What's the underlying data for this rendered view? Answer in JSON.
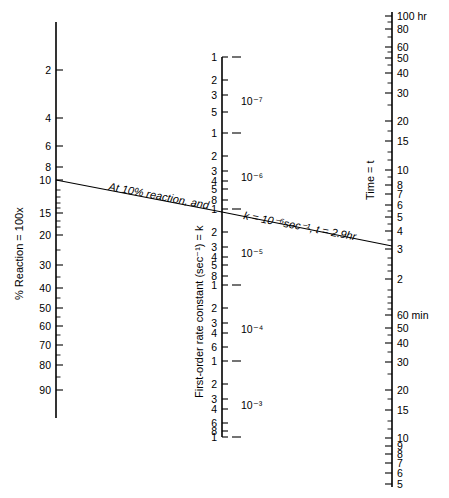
{
  "figure": {
    "type": "nomogram",
    "background_color": "#ffffff",
    "line_color": "#000000",
    "width": 449,
    "height": 498
  },
  "chart_data": {
    "type": "line",
    "title": "",
    "subtitle": "",
    "xlabel": "",
    "ylabel": "",
    "grid": false,
    "legend": "none",
    "axes": [
      {
        "id": "percent-reaction",
        "position": "left",
        "title": "% Reaction = 100x",
        "scale": "logarithmic-probability",
        "x_px": 56,
        "y_top_px": 22,
        "y_bottom_px": 418,
        "labeled_ticks": [
          {
            "label": "2",
            "y": 70
          },
          {
            "label": "4",
            "y": 118
          },
          {
            "label": "6",
            "y": 146
          },
          {
            "label": "8",
            "y": 167
          },
          {
            "label": "10",
            "y": 180
          },
          {
            "label": "15",
            "y": 213
          },
          {
            "label": "20",
            "y": 235
          },
          {
            "label": "30",
            "y": 265
          },
          {
            "label": "40",
            "y": 288
          },
          {
            "label": "50",
            "y": 308
          },
          {
            "label": "60",
            "y": 326
          },
          {
            "label": "70",
            "y": 345
          },
          {
            "label": "80",
            "y": 365
          },
          {
            "label": "90",
            "y": 390
          }
        ],
        "minor_ticks_y": [
          190,
          197,
          203,
          208,
          221,
          227,
          250,
          277,
          298,
          317,
          335,
          355,
          377
        ]
      },
      {
        "id": "rate-constant",
        "position": "center",
        "title": "First-order rate constant (sec⁻¹) = k",
        "scale": "logarithmic",
        "x_px": 222,
        "y_top_px": 57,
        "y_bottom_px": 437,
        "decade_labels": [
          {
            "label": "10⁻⁷",
            "y": 101
          },
          {
            "label": "10⁻⁶",
            "y": 177
          },
          {
            "label": "10⁻⁵",
            "y": 253
          },
          {
            "label": "10⁻⁴",
            "y": 329
          },
          {
            "label": "10⁻³",
            "y": 405
          }
        ],
        "decade_marks_y": [
          57,
          133,
          209,
          285,
          361,
          437
        ],
        "labeled_ticks": [
          {
            "label": "1",
            "y": 57
          },
          {
            "label": "2",
            "y": 80
          },
          {
            "label": "3",
            "y": 95
          },
          {
            "label": "5",
            "y": 112
          },
          {
            "label": "1",
            "y": 133
          },
          {
            "label": "2",
            "y": 156
          },
          {
            "label": "3",
            "y": 171
          },
          {
            "label": "4",
            "y": 181
          },
          {
            "label": "5",
            "y": 189
          },
          {
            "label": "8",
            "y": 200
          },
          {
            "label": "1",
            "y": 209
          },
          {
            "label": "2",
            "y": 232
          },
          {
            "label": "3",
            "y": 247
          },
          {
            "label": "4",
            "y": 257
          },
          {
            "label": "5",
            "y": 265
          },
          {
            "label": "8",
            "y": 276
          },
          {
            "label": "1",
            "y": 285
          },
          {
            "label": "2",
            "y": 308
          },
          {
            "label": "3",
            "y": 323
          },
          {
            "label": "4",
            "y": 333
          },
          {
            "label": "6",
            "y": 347
          },
          {
            "label": "1",
            "y": 361
          },
          {
            "label": "2",
            "y": 384
          },
          {
            "label": "3",
            "y": 399
          },
          {
            "label": "4",
            "y": 409
          },
          {
            "label": "6",
            "y": 423
          },
          {
            "label": "8",
            "y": 431
          },
          {
            "label": "1",
            "y": 437
          }
        ]
      },
      {
        "id": "time",
        "position": "right",
        "title": "Time = t",
        "scale": "logarithmic",
        "x_px": 392,
        "y_top_px": 12,
        "y_bottom_px": 485,
        "labeled_ticks": [
          {
            "label": "100 hr",
            "y": 16
          },
          {
            "label": "80",
            "y": 29
          },
          {
            "label": "60",
            "y": 47
          },
          {
            "label": "50",
            "y": 58
          },
          {
            "label": "40",
            "y": 73
          },
          {
            "label": "30",
            "y": 93
          },
          {
            "label": "20",
            "y": 121
          },
          {
            "label": "15",
            "y": 141
          },
          {
            "label": "10",
            "y": 170
          },
          {
            "label": "8",
            "y": 185
          },
          {
            "label": "7",
            "y": 194
          },
          {
            "label": "6",
            "y": 205
          },
          {
            "label": "5",
            "y": 217
          },
          {
            "label": "4",
            "y": 231
          },
          {
            "label": "3",
            "y": 249
          },
          {
            "label": "2",
            "y": 279
          },
          {
            "label": "60 min",
            "y": 315
          },
          {
            "label": "50",
            "y": 328
          },
          {
            "label": "40",
            "y": 343
          },
          {
            "label": "30",
            "y": 362
          },
          {
            "label": "20",
            "y": 390
          },
          {
            "label": "15",
            "y": 410
          },
          {
            "label": "10",
            "y": 438
          },
          {
            "label": "9",
            "y": 446
          },
          {
            "label": "8",
            "y": 454
          },
          {
            "label": "7",
            "y": 463
          },
          {
            "label": "6",
            "y": 473
          },
          {
            "label": "5",
            "y": 484
          }
        ],
        "minor_ticks_y": [
          22,
          37,
          52,
          65,
          83,
          105,
          131,
          152,
          160,
          177,
          211,
          224,
          240,
          258,
          265,
          271,
          290,
          297,
          303,
          309,
          335,
          352,
          374,
          399,
          421,
          429
        ]
      }
    ],
    "index_line": {
      "label": "example alignment",
      "points_px": [
        [
          56,
          180
        ],
        [
          222,
          212
        ],
        [
          392,
          246
        ]
      ],
      "annotation_left": "At 10% reaction, and",
      "annotation_right": "k = 10⁻⁶sec⁻¹, t = 2.9hr",
      "values": {
        "percent_reaction": "10",
        "rate_constant": "10⁻⁶ sec⁻¹",
        "time": "2.9 hr"
      }
    }
  },
  "labels": {
    "left_axis_title": "% Reaction = 100x",
    "center_axis_title": "First-order rate constant (sec⁻¹) = k",
    "right_axis_title": "Time = t",
    "annotation_left": "At 10% reaction, and",
    "annotation_right": "k = 10⁻⁶sec⁻¹, t = 2.9hr"
  }
}
